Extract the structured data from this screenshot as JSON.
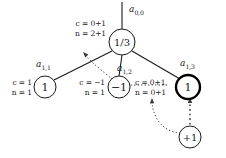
{
  "diagram": {
    "type": "tree",
    "background_color": "#ffffff",
    "line_color": "#1a1a1a",
    "highlight_color": "#000000"
  },
  "nodes": {
    "root": {
      "id": "a00",
      "value": "1/3",
      "label_base": "a",
      "label_sub": "0,0",
      "cx": 122,
      "cy": 42,
      "r": 13,
      "stroke_width": 1,
      "annotation": {
        "c": "c = 0+1",
        "n": "n = 2+1"
      }
    },
    "child1": {
      "id": "a11",
      "value": "1",
      "label_base": "a",
      "label_sub": "1,1",
      "cx": 45,
      "cy": 87,
      "r": 11,
      "stroke_width": 1,
      "annotation": {
        "c": "c = 1",
        "n": "n = 1"
      }
    },
    "child2": {
      "id": "a12",
      "value": "−1",
      "label_base": "a",
      "label_sub": "1,2",
      "cx": 119,
      "cy": 87,
      "r": 11,
      "stroke_width": 1,
      "annotation": {
        "c": "c = −1",
        "n": "n = 1"
      }
    },
    "child3": {
      "id": "a13",
      "value": "1",
      "label_base": "a",
      "label_sub": "1,3",
      "cx": 188,
      "cy": 87,
      "r": 12,
      "stroke_width": 2.4,
      "annotation": {
        "c": "c = 0+1",
        "n": "n = 0+1"
      }
    },
    "leaf": {
      "id": "leaf",
      "value": "+1",
      "cx": 190,
      "cy": 137,
      "r": 11,
      "stroke_width": 1
    }
  }
}
